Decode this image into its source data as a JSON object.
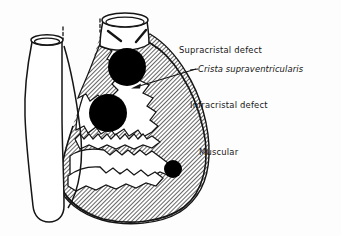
{
  "figure": {
    "width": 341,
    "height": 236,
    "background_color": "#fdfdfd",
    "ink_color": "#151515",
    "hatch_color": "#1a1a1a",
    "defect_fill_color": "#000000"
  },
  "labels": {
    "supracristal": "Supracristal defect",
    "crista": "Crista supraventricularis",
    "infracristal": "Infracristal defect",
    "muscular": "Muscular"
  },
  "annotations": [
    {
      "name": "supracristal-defect",
      "label": "Supracristal defect",
      "style": "normal",
      "label_x": 179,
      "label_y": 46,
      "marker": {
        "shape": "filled-circle",
        "cx": 127,
        "cy": 67,
        "r": 19
      }
    },
    {
      "name": "crista-supraventricularis",
      "label": "Crista supraventricularis",
      "style": "italic",
      "label_x": 198,
      "label_y": 65,
      "leader": {
        "shape": "arrow",
        "x1": 196,
        "y1": 70,
        "x2": 132,
        "y2": 88
      }
    },
    {
      "name": "infracristal-defect",
      "label": "Infracristal defect",
      "style": "normal",
      "label_x": 190,
      "label_y": 101,
      "marker": {
        "shape": "filled-circle",
        "cx": 108,
        "cy": 113,
        "r": 19
      }
    },
    {
      "name": "muscular-defect",
      "label": "Muscular",
      "style": "normal",
      "label_x": 199,
      "label_y": 148,
      "marker": {
        "shape": "filled-circle",
        "cx": 173,
        "cy": 169,
        "r": 9
      }
    }
  ],
  "anatomy": {
    "great_vessels": [
      {
        "name": "aorta",
        "position": "left",
        "rim_cx": 47,
        "rim_cy": 40,
        "rim_rx": 16,
        "rim_ry": 5
      },
      {
        "name": "pulmonary-artery",
        "position": "right",
        "rim_cx": 125,
        "rim_cy": 20,
        "rim_rx": 23,
        "rim_ry": 7
      }
    ],
    "chamber": {
      "name": "right-ventricle",
      "wall_texture": "diagonal-hatch",
      "hatch_angle_deg": 45,
      "hatch_spacing_px": 2.1
    },
    "tick_marks": [
      {
        "name": "aorta-tick",
        "x": 63,
        "y_top": 27,
        "y_bottom": 38
      },
      {
        "name": "pulmonary-tick",
        "x": 100,
        "y_top": 19,
        "y_bottom": 31
      }
    ]
  }
}
